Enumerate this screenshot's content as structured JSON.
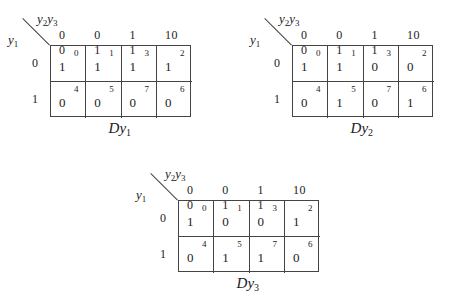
{
  "maps": [
    {
      "name": "Dy1",
      "title_main": "Dy",
      "title_sub": "1",
      "col_var": "y2y3",
      "row_var": "y1",
      "col_headers": [
        "0 0",
        "0 1",
        "1 1",
        "10"
      ],
      "row_headers": [
        "0",
        "1"
      ],
      "cells": [
        [
          {
            "value": "1",
            "index": "0"
          },
          {
            "value": "1",
            "index": "1"
          },
          {
            "value": "1",
            "index": "3"
          },
          {
            "value": "1",
            "index": "2"
          }
        ],
        [
          {
            "value": "0",
            "index": "4"
          },
          {
            "value": "0",
            "index": "5"
          },
          {
            "value": "0",
            "index": "7"
          },
          {
            "value": "0",
            "index": "6"
          }
        ]
      ]
    },
    {
      "name": "Dy2",
      "title_main": "Dy",
      "title_sub": "2",
      "col_var": "y2y3",
      "row_var": "y1",
      "col_headers": [
        "0 0",
        "0 1",
        "1 1",
        "10"
      ],
      "row_headers": [
        "0",
        "1"
      ],
      "cells": [
        [
          {
            "value": "1",
            "index": "0"
          },
          {
            "value": "1",
            "index": "1"
          },
          {
            "value": "0",
            "index": "3"
          },
          {
            "value": "0",
            "index": "2"
          }
        ],
        [
          {
            "value": "0",
            "index": "4"
          },
          {
            "value": "1",
            "index": "5"
          },
          {
            "value": "0",
            "index": "7"
          },
          {
            "value": "1",
            "index": "6"
          }
        ]
      ]
    },
    {
      "name": "Dy3",
      "title_main": "Dy",
      "title_sub": "3",
      "col_var": "y2y3",
      "row_var": "y1",
      "col_headers": [
        "0 0",
        "0 1",
        "1 1",
        "10"
      ],
      "row_headers": [
        "0",
        "1"
      ],
      "cells": [
        [
          {
            "value": "1",
            "index": "0"
          },
          {
            "value": "0",
            "index": "1"
          },
          {
            "value": "0",
            "index": "3"
          },
          {
            "value": "1",
            "index": "2"
          }
        ],
        [
          {
            "value": "0",
            "index": "4"
          },
          {
            "value": "1",
            "index": "5"
          },
          {
            "value": "1",
            "index": "7"
          },
          {
            "value": "0",
            "index": "6"
          }
        ]
      ]
    }
  ],
  "labels": {
    "y": "y",
    "sub1": "1",
    "sub2": "2",
    "sub3": "3"
  }
}
